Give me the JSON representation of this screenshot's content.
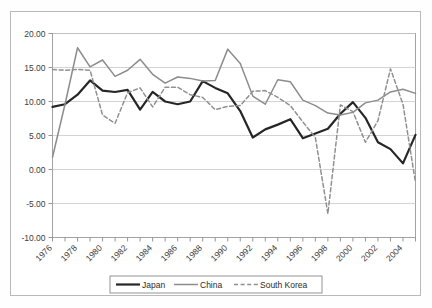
{
  "chart_data": {
    "type": "line",
    "title": "",
    "xlabel": "",
    "ylabel": "",
    "ylim": [
      -10,
      20
    ],
    "ytick_labels": [
      "20.00",
      "15.00",
      "10.00",
      "5.00",
      "0.00",
      "-5.00",
      "-10.00"
    ],
    "ytick_values": [
      20,
      15,
      10,
      5,
      0,
      -5,
      -10
    ],
    "grid": true,
    "legend_position": "bottom-center",
    "x": [
      1976,
      1977,
      1978,
      1979,
      1980,
      1981,
      1982,
      1983,
      1984,
      1985,
      1986,
      1987,
      1988,
      1989,
      1990,
      1991,
      1992,
      1993,
      1994,
      1995,
      1996,
      1997,
      1998,
      1999,
      2000,
      2001,
      2002,
      2003,
      2004,
      2005
    ],
    "xtick_labels": [
      "1976",
      "1978",
      "1980",
      "1982",
      "1984",
      "1986",
      "1988",
      "1990",
      "1992",
      "1994",
      "1996",
      "1998",
      "2000",
      "2002",
      "2004"
    ],
    "xtick_values": [
      1976,
      1978,
      1980,
      1982,
      1984,
      1986,
      1988,
      1990,
      1992,
      1994,
      1996,
      1998,
      2000,
      2002,
      2004
    ],
    "series": [
      {
        "name": "Japan",
        "color": "#262626",
        "width": 2.2,
        "dash": "none",
        "values": [
          9.2,
          9.6,
          11.0,
          13.1,
          11.6,
          11.4,
          11.7,
          8.8,
          11.4,
          10.0,
          9.6,
          10.0,
          13.0,
          12.0,
          11.2,
          8.6,
          4.7,
          5.9,
          6.6,
          7.4,
          4.6,
          5.3,
          6.0,
          8.2,
          9.9,
          7.6,
          4.0,
          3.0,
          0.9,
          5.1
        ]
      },
      {
        "name": "China",
        "color": "#8c8c8c",
        "width": 1.5,
        "dash": "none",
        "values": [
          1.8,
          9.6,
          17.9,
          15.1,
          16.1,
          13.7,
          14.6,
          16.2,
          14.0,
          12.7,
          13.6,
          13.4,
          13.0,
          13.1,
          17.7,
          15.6,
          10.8,
          9.6,
          13.2,
          12.9,
          10.2,
          9.4,
          8.3,
          8.0,
          8.4,
          9.8,
          10.2,
          11.4,
          11.8,
          11.2
        ]
      },
      {
        "name": "South Korea",
        "color": "#909090",
        "width": 1.5,
        "dash": "dashed",
        "values": [
          14.7,
          14.6,
          14.7,
          14.6,
          8.0,
          6.8,
          11.3,
          12.0,
          9.2,
          12.1,
          12.1,
          11.0,
          10.6,
          8.8,
          9.3,
          9.4,
          11.5,
          11.6,
          10.6,
          9.4,
          7.0,
          4.7,
          -6.5,
          9.5,
          8.5,
          4.0,
          7.2,
          14.8,
          9.6,
          -1.9
        ]
      }
    ]
  },
  "legend": {
    "items": [
      {
        "label": "Japan",
        "style": "solid-thick",
        "color": "#262626"
      },
      {
        "label": "China",
        "style": "solid-thin",
        "color": "#8c8c8c"
      },
      {
        "label": "South Korea",
        "style": "dashed",
        "color": "#909090"
      }
    ]
  }
}
